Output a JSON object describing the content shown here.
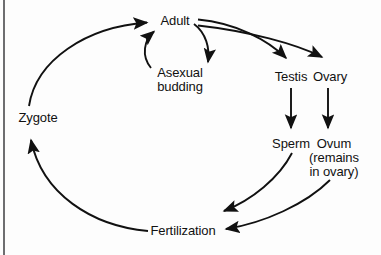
{
  "diagram": {
    "background_color": "#fdfdfd",
    "ink_color": "#111111",
    "rule_color": "#6e6e70",
    "nodes": {
      "adult": {
        "label": "Adult"
      },
      "asexual_budding": {
        "line1": "Asexual",
        "line2": "budding"
      },
      "testis": {
        "label": "Testis"
      },
      "ovary": {
        "label": "Ovary"
      },
      "sperm": {
        "label": "Sperm"
      },
      "ovum": {
        "line1": "Ovum",
        "line2": "(remains",
        "line3": "in ovary)"
      },
      "zygote": {
        "label": "Zygote"
      },
      "fertilization": {
        "label": "Fertilization"
      }
    },
    "edges": [
      {
        "name": "zygote-to-adult",
        "from": "Zygote",
        "to": "Adult"
      },
      {
        "name": "adult-to-asexual-budding",
        "from": "Adult",
        "to": "Asexual budding"
      },
      {
        "name": "asexual-budding-to-adult",
        "from": "Asexual budding",
        "to": "Adult"
      },
      {
        "name": "adult-to-testis",
        "from": "Adult",
        "to": "Testis"
      },
      {
        "name": "adult-to-ovary",
        "from": "Adult",
        "to": "Ovary"
      },
      {
        "name": "testis-to-sperm",
        "from": "Testis",
        "to": "Sperm"
      },
      {
        "name": "ovary-to-ovum",
        "from": "Ovary",
        "to": "Ovum"
      },
      {
        "name": "sperm-to-fertilization",
        "from": "Sperm",
        "to": "Fertilization"
      },
      {
        "name": "ovum-to-fertilization",
        "from": "Ovum",
        "to": "Fertilization"
      },
      {
        "name": "fertilization-to-zygote",
        "from": "Fertilization",
        "to": "Zygote"
      }
    ]
  }
}
